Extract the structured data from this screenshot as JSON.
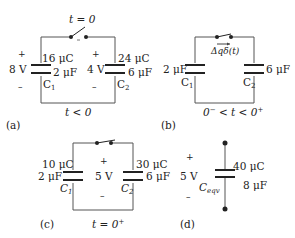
{
  "panels": {
    "a": {
      "tag": "(a)",
      "time": "t < 0",
      "switch_label": "t = 0",
      "c1": {
        "name": "C",
        "sub": "1",
        "charge": "16 μC",
        "cap": "2 μF",
        "voltage": "8 V"
      },
      "c2": {
        "name": "C",
        "sub": "2",
        "charge": "24 μC",
        "cap": "6 μF",
        "voltage": "4 V"
      },
      "plus": "+",
      "minus": "–"
    },
    "b": {
      "tag": "(b)",
      "time_pre": "0",
      "time_pre_sup": "−",
      "time_mid": " < t < 0",
      "time_post_sup": "+",
      "impulse": "Δqδ(t)",
      "c1": {
        "name": "C",
        "sub": "1",
        "cap": "2 μF"
      },
      "c2": {
        "name": "C",
        "sub": "2",
        "cap": "6 μF"
      }
    },
    "c": {
      "tag": "(c)",
      "time": "t = 0",
      "time_sup": "+",
      "voltage": "5 V",
      "plus": "+",
      "minus": "–",
      "c1": {
        "name": "C",
        "sub": "1",
        "charge": "10 μC",
        "cap": "2 μF"
      },
      "c2": {
        "name": "C",
        "sub": "2",
        "charge": "30 μC",
        "cap": "6 μF"
      }
    },
    "d": {
      "tag": "(d)",
      "voltage": "5 V",
      "plus": "+",
      "minus": "–",
      "ceq": {
        "name": "C",
        "sub": "eqv",
        "charge": "40 μC",
        "cap": "8 μF"
      }
    }
  },
  "colors": {
    "wire": "#555555",
    "plate": "#222222",
    "text": "#222222"
  }
}
